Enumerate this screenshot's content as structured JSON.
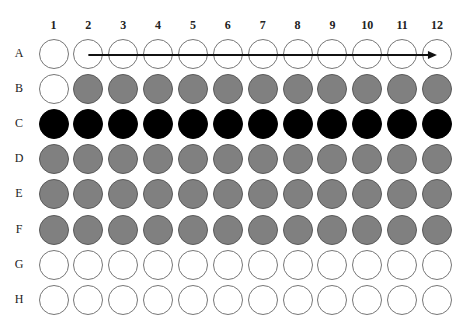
{
  "plate": {
    "columns": [
      "1",
      "2",
      "3",
      "4",
      "5",
      "6",
      "7",
      "8",
      "9",
      "10",
      "11",
      "12"
    ],
    "rows": [
      "A",
      "B",
      "C",
      "D",
      "E",
      "F",
      "G",
      "H"
    ],
    "wells": {
      "A": [
        "empty",
        "empty",
        "empty",
        "empty",
        "empty",
        "empty",
        "empty",
        "empty",
        "empty",
        "empty",
        "empty",
        "empty"
      ],
      "B": [
        "empty",
        "gray",
        "gray",
        "gray",
        "gray",
        "gray",
        "gray",
        "gray",
        "gray",
        "gray",
        "gray",
        "gray"
      ],
      "C": [
        "black",
        "black",
        "black",
        "black",
        "black",
        "black",
        "black",
        "black",
        "black",
        "black",
        "black",
        "black"
      ],
      "D": [
        "gray",
        "gray",
        "gray",
        "gray",
        "gray",
        "gray",
        "gray",
        "gray",
        "gray",
        "gray",
        "gray",
        "gray"
      ],
      "E": [
        "gray",
        "gray",
        "gray",
        "gray",
        "gray",
        "gray",
        "gray",
        "gray",
        "gray",
        "gray",
        "gray",
        "gray"
      ],
      "F": [
        "gray",
        "gray",
        "gray",
        "gray",
        "gray",
        "gray",
        "gray",
        "gray",
        "gray",
        "gray",
        "gray",
        "gray"
      ],
      "G": [
        "empty",
        "empty",
        "empty",
        "empty",
        "empty",
        "empty",
        "empty",
        "empty",
        "empty",
        "empty",
        "empty",
        "empty"
      ],
      "H": [
        "empty",
        "empty",
        "empty",
        "empty",
        "empty",
        "empty",
        "empty",
        "empty",
        "empty",
        "empty",
        "empty",
        "empty"
      ]
    },
    "arrow": {
      "row": "A",
      "from_column": "2",
      "to_column": "12",
      "direction": "right"
    },
    "colors": {
      "empty": "#ffffff",
      "gray": "#808080",
      "black": "#000000",
      "outline": "#777777"
    }
  }
}
